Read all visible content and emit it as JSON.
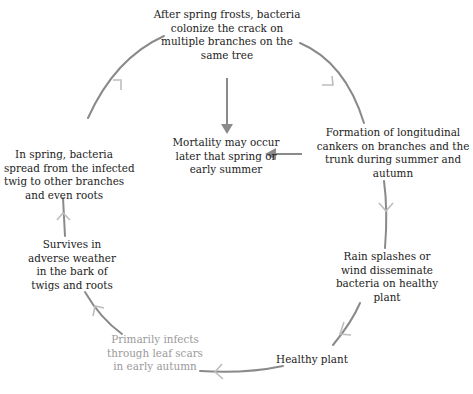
{
  "diagram": {
    "title": "",
    "type": "cycle",
    "colors": {
      "text": "#222222",
      "faded_text": "#9a9a9a",
      "arc_dark": "#8a8a8a",
      "arc_light": "#bdbdbd",
      "arrow_solid": "#8a8a8a"
    },
    "nodes": [
      {
        "id": "n1",
        "lines": [
          "After spring frosts, bacteria",
          "colonize the crack on",
          "multiple branches on the",
          "same tree"
        ]
      },
      {
        "id": "n2",
        "lines": [
          "Formation of longitudinal",
          "cankers on branches and the",
          "trunk during summer and",
          "autumn"
        ]
      },
      {
        "id": "n3",
        "lines": [
          "Rain splashes or",
          "wind disseminate",
          "bacteria on healthy",
          "plant"
        ]
      },
      {
        "id": "n4",
        "lines": [
          "Healthy plant"
        ]
      },
      {
        "id": "n5",
        "lines": [
          "Primarily infects",
          "through leaf scars",
          "in early autumn"
        ],
        "style": "faded"
      },
      {
        "id": "n6",
        "lines": [
          "Survives in",
          "adverse weather",
          "in the bark of",
          "twigs and roots"
        ]
      },
      {
        "id": "n7",
        "lines": [
          "In spring, bacteria",
          "spread from the infected",
          "twig to other branches",
          "and even roots"
        ]
      },
      {
        "id": "center",
        "lines": [
          "Mortality may occur",
          "later that spring or",
          "early summer"
        ]
      }
    ],
    "edges": [
      {
        "from": "n1",
        "to": "n2",
        "style": "open-arrow-arc"
      },
      {
        "from": "n2",
        "to": "n3",
        "style": "open-arrow-arc"
      },
      {
        "from": "n3",
        "to": "n4",
        "style": "open-arrow-arc"
      },
      {
        "from": "n4",
        "to": "n5",
        "style": "open-arrow-arc"
      },
      {
        "from": "n5",
        "to": "n6",
        "style": "open-arrow-arc"
      },
      {
        "from": "n6",
        "to": "n7",
        "style": "open-arrow-arc"
      },
      {
        "from": "n7",
        "to": "n1",
        "style": "open-arrow-arc"
      },
      {
        "from": "n1",
        "to": "center",
        "style": "solid-arrow-straight"
      },
      {
        "from": "n2",
        "to": "center",
        "style": "solid-arrow-straight"
      }
    ]
  }
}
